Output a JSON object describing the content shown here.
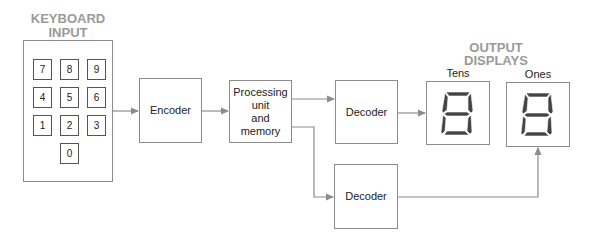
{
  "keyboard": {
    "title_line1": "KEYBOARD",
    "title_line2": "INPUT",
    "keys": [
      "7",
      "8",
      "9",
      "4",
      "5",
      "6",
      "1",
      "2",
      "3",
      "0"
    ]
  },
  "blocks": {
    "encoder": "Encoder",
    "processing_line1": "Processing",
    "processing_line2": "unit",
    "processing_line3": "and",
    "processing_line4": "memory",
    "decoder_tens": "Decoder",
    "decoder_ones": "Decoder"
  },
  "output": {
    "title_line1": "OUTPUT",
    "title_line2": "DISPLAYS",
    "tens_label": "Tens",
    "ones_label": "Ones",
    "tens_digit": "8",
    "ones_digit": "8"
  },
  "colors": {
    "title": "#9a9a9a",
    "line": "#8c8c8c",
    "segment": "#444444"
  }
}
